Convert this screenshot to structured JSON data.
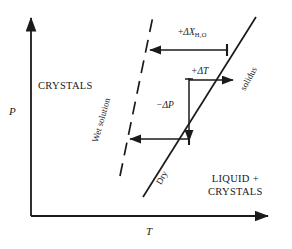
{
  "figure": {
    "type": "phase-diagram",
    "background_color": "#ffffff",
    "line_color": "#1a1a1a",
    "text_color": "#1a1a1a"
  },
  "axes": {
    "y": {
      "label": "P",
      "name": "pressure-axis",
      "arrow": "up"
    },
    "x": {
      "label": "T",
      "name": "temperature-axis",
      "arrow": "right"
    }
  },
  "regions": [
    {
      "id": "crystals",
      "label": "CRYSTALS"
    },
    {
      "id": "liquid_crystals",
      "line1": "LIQUID +",
      "line2": "CRYSTALS"
    }
  ],
  "curves": [
    {
      "id": "solidus",
      "label": "solidus",
      "style": "solid"
    },
    {
      "id": "dry",
      "label": "Dry",
      "style": "solid"
    },
    {
      "id": "wet_solution",
      "label": "Wet solution",
      "style": "dashed"
    }
  ],
  "annotations": [
    {
      "id": "delta_x_h2o",
      "sign": "+",
      "symbol": "ΔX",
      "subscript": "H₂O",
      "text": "+ΔX H₂O",
      "arrow": "left"
    },
    {
      "id": "delta_t",
      "sign": "+",
      "symbol": "ΔT",
      "text": "+ΔT",
      "arrow": "right"
    },
    {
      "id": "delta_p",
      "sign": "−",
      "symbol": "ΔP",
      "text": "−ΔP",
      "arrow": "down"
    },
    {
      "id": "delta_x_h2o_lower",
      "arrow": "left"
    }
  ]
}
